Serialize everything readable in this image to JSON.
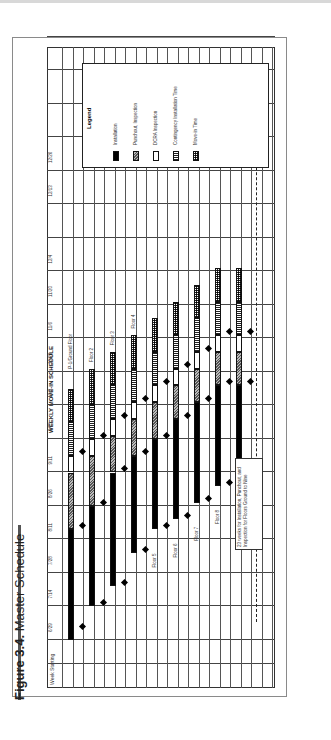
{
  "figure": {
    "label": "Figure 3.4.",
    "title": "Master Schedule"
  },
  "chart_data": {
    "type": "gantt",
    "title": "WEEKLY MOVE-IN SCHEDULE",
    "row_header": "Week Starting",
    "weeks": [
      "6/29",
      "7/14",
      "7/28",
      "8/11",
      "8/26",
      "9/11",
      "9/25",
      "10/9",
      "10/23",
      "11/6",
      "11/20",
      "12/4",
      "",
      "12/13",
      "12/26"
    ],
    "legend_title": "Legend",
    "legend": [
      {
        "key": "inst",
        "label": "Installation"
      },
      {
        "key": "punch",
        "label": "Punchout, Inspection"
      },
      {
        "key": "dcra",
        "label": "DCRA Inspection"
      },
      {
        "key": "cont",
        "label": "Contingency Installation Time"
      },
      {
        "key": "move",
        "label": "Move-in Time"
      }
    ],
    "floors": [
      {
        "name": "P-1/Ground Floor",
        "segments": [
          [
            "inst",
            0,
            3.3
          ],
          [
            "punch",
            3.3,
            5
          ],
          [
            "dcra",
            5,
            5.5
          ],
          [
            "cont",
            5.5,
            6.5
          ],
          [
            "move",
            6.5,
            7.5
          ]
        ],
        "milestones": [
          0.4,
          3.4,
          5.6
        ]
      },
      {
        "name": "Floor 2",
        "segments": [
          [
            "inst",
            1,
            4
          ],
          [
            "punch",
            4,
            5.5
          ],
          [
            "dcra",
            5.5,
            6
          ],
          [
            "cont",
            6,
            7
          ],
          [
            "move",
            7,
            8.1
          ]
        ],
        "milestones": [
          1.1,
          4.1,
          6.1
        ]
      },
      {
        "name": "Floor 3",
        "segments": [
          [
            "inst",
            1.6,
            5
          ],
          [
            "punch",
            5,
            6.1
          ],
          [
            "dcra",
            6.1,
            6.6
          ],
          [
            "cont",
            6.6,
            7.6
          ],
          [
            "move",
            7.6,
            8.6
          ]
        ],
        "milestones": [
          1.7,
          5.1,
          6.7
        ]
      },
      {
        "name": "Floor 4",
        "segments": [
          [
            "inst",
            2.6,
            5.5
          ],
          [
            "punch",
            5.5,
            6.6
          ],
          [
            "dcra",
            6.6,
            7.1
          ],
          [
            "cont",
            7.1,
            8.1
          ],
          [
            "move",
            8.1,
            9.1
          ]
        ],
        "milestones": [
          2.7,
          5.6,
          7.2
        ]
      },
      {
        "name": "Floor 5",
        "segments": [
          [
            "inst",
            3.3,
            6
          ],
          [
            "punch",
            6,
            7.1
          ],
          [
            "dcra",
            7.1,
            7.6
          ],
          [
            "cont",
            7.6,
            8.6
          ],
          [
            "move",
            8.6,
            9.6
          ]
        ],
        "milestones": [
          3.4,
          6.1,
          7.7
        ]
      },
      {
        "name": "Floor 6",
        "segments": [
          [
            "inst",
            3.6,
            6.6
          ],
          [
            "punch",
            6.6,
            7.6
          ],
          [
            "dcra",
            7.6,
            8.1
          ],
          [
            "cont",
            8.1,
            9.1
          ],
          [
            "move",
            9.1,
            10.1
          ]
        ],
        "milestones": [
          3.7,
          6.7,
          8.2
        ]
      },
      {
        "name": "Floor 7",
        "segments": [
          [
            "inst",
            4.1,
            7.1
          ],
          [
            "punch",
            7.1,
            8.1
          ],
          [
            "dcra",
            8.1,
            8.6
          ],
          [
            "cont",
            8.6,
            9.6
          ],
          [
            "move",
            9.6,
            10.6
          ]
        ],
        "milestones": [
          4.2,
          7.2,
          8.7
        ]
      },
      {
        "name": "Floor 8",
        "segments": [
          [
            "inst",
            4.6,
            7.6
          ],
          [
            "punch",
            7.6,
            8.6
          ],
          [
            "dcra",
            8.6,
            9.1
          ],
          [
            "cont",
            9.1,
            10.1
          ],
          [
            "move",
            10.1,
            11.1
          ]
        ],
        "milestones": [
          4.7,
          7.7,
          9.2
        ]
      },
      {
        "name": "Floor 9",
        "segments": [
          [
            "inst",
            4.6,
            7.6
          ],
          [
            "punch",
            7.6,
            8.6
          ],
          [
            "dcra",
            8.6,
            9.1
          ],
          [
            "cont",
            9.1,
            10.1
          ],
          [
            "move",
            10.1,
            11.1
          ]
        ],
        "milestones": [
          4.7,
          7.7,
          9.2
        ]
      }
    ],
    "annotation": "23 weeks for Installation, Punchout, and Inspection for Floors Ground to Nine",
    "span_weeks": 23
  }
}
